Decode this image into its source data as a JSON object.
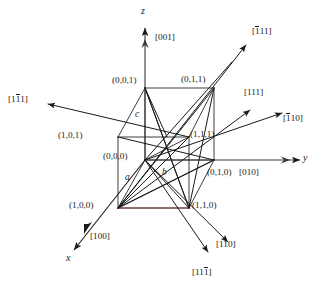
{
  "figure": {
    "colors": {
      "line": "#1a1a1a",
      "accent_edge": "#8a3b3b",
      "background": "#ffffff"
    }
  },
  "axes": [
    {
      "name": "z-axis",
      "symbol": "z",
      "index_label": "[001]"
    },
    {
      "name": "y-axis",
      "symbol": "y",
      "index_label": "[010]"
    },
    {
      "name": "x-axis",
      "symbol": "x",
      "index_label": "[100]"
    }
  ],
  "lattice_parameters": [
    {
      "name": "a",
      "symbol": "a"
    },
    {
      "name": "b",
      "symbol": "b"
    },
    {
      "name": "c",
      "symbol": "c"
    }
  ],
  "vertices": [
    {
      "name": "origin",
      "label": "(0,0,0)"
    },
    {
      "name": "vertex-001",
      "label": "(0,0,1)"
    },
    {
      "name": "vertex-011",
      "label": "(0,1,1)"
    },
    {
      "name": "vertex-101",
      "label": "(1,0,1)"
    },
    {
      "name": "vertex-111",
      "label": "(1,1,1)"
    },
    {
      "name": "vertex-010",
      "label": "(0,1,0)"
    },
    {
      "name": "vertex-100",
      "label": "(1,0,0)"
    },
    {
      "name": "vertex-110",
      "label": "(1,1,0)"
    }
  ],
  "directions": [
    {
      "name": "direction-1bar11",
      "label": "[1̑1]",
      "parts": [
        "1",
        "1",
        "1"
      ],
      "bar_index": 1,
      "display": "[11̅1]"
    },
    {
      "name": "direction-bar111",
      "label": "[̑1 1 1]",
      "parts": [
        "1",
        "1",
        "1"
      ],
      "bar_index": 0,
      "display": "[̅1 1 1]"
    },
    {
      "name": "direction-111",
      "label": "[111]",
      "parts": [
        "1",
        "1",
        "1"
      ],
      "bar_index": -1,
      "display": "[111]"
    },
    {
      "name": "direction-bar110",
      "label": "[̑1 1 0]",
      "parts": [
        "1",
        "1",
        "0"
      ],
      "bar_index": 0,
      "display": "[̅1 1 0]"
    },
    {
      "name": "direction-110",
      "label": "[110]",
      "parts": [
        "1",
        "1",
        "0"
      ],
      "bar_index": -1,
      "display": "[110]"
    },
    {
      "name": "direction-11bar1",
      "label": "[11̑1]",
      "parts": [
        "1",
        "1",
        "1"
      ],
      "bar_index": 2,
      "display": "[111̅]"
    }
  ],
  "labels": {
    "z_symbol": "z",
    "z_index": "[001]",
    "y_symbol": "y",
    "y_index": "[010]",
    "x_symbol": "x",
    "x_index": "[100]",
    "param_a": "a",
    "param_b": "b",
    "param_c": "c",
    "v_000": "(0,0,0)",
    "v_001": "(0,0,1)",
    "v_011": "(0,1,1)",
    "v_101": "(1,0,1)",
    "v_111": "(1,1,1)",
    "v_010": "(0,1,0)",
    "v_100": "(1,0,0)",
    "v_110": "(1,1,0)",
    "dir_1b11_open": "[1",
    "dir_1b11_bar": "1",
    "dir_1b11_close": "1]",
    "dir_b111_open": "[",
    "dir_b111_bar": "1",
    "dir_b111_close": "11]",
    "dir_111": "[111]",
    "dir_b110_open": "[",
    "dir_b110_bar": "1",
    "dir_b110_close": "10]",
    "dir_110": "[110]",
    "dir_11b1_open": "[11",
    "dir_11b1_bar": "1",
    "dir_11b1_close": "]"
  }
}
